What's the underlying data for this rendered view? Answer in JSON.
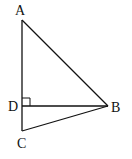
{
  "diagram": {
    "type": "geometry-triangle",
    "points": {
      "A": {
        "label": "A",
        "x": 22,
        "y": 20
      },
      "B": {
        "label": "B",
        "x": 108,
        "y": 106
      },
      "C": {
        "label": "C",
        "x": 22,
        "y": 131
      },
      "D": {
        "label": "D",
        "x": 22,
        "y": 106
      }
    },
    "segments": [
      "AB",
      "BC",
      "AC",
      "DB"
    ],
    "right_angle_at": "D",
    "line_color": "#111111"
  }
}
